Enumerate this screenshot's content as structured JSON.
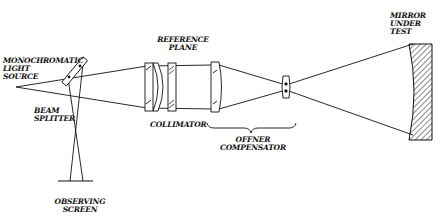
{
  "diagram": {
    "type": "optical interferometer setup (Fizeau with Offner null compensator)",
    "colors": {
      "line": "#111111",
      "background": "#ffffff"
    },
    "labels": {
      "light_source": "MONOCHROMATIC\nLIGHT\nSOURCE",
      "beam_splitter": "BEAM\nSPLITTER",
      "collimator": "COLLIMATOR",
      "reference_plane": "REFERENCE\nPLANE",
      "offner_compensator": "OFFNER\nCOMPENSATOR",
      "mirror_under_test": "MIRROR\nUNDER\nTEST",
      "observing_screen": "OBSERVING\nSCREEN"
    },
    "components": [
      {
        "id": "light-source",
        "label": "MONOCHROMATIC LIGHT SOURCE"
      },
      {
        "id": "beam-splitter",
        "label": "BEAM SPLITTER"
      },
      {
        "id": "collimator",
        "label": "COLLIMATOR"
      },
      {
        "id": "reference-plane",
        "label": "REFERENCE PLANE"
      },
      {
        "id": "offner-compensator",
        "label": "OFFNER COMPENSATOR"
      },
      {
        "id": "mirror-under-test",
        "label": "MIRROR UNDER TEST"
      },
      {
        "id": "observing-screen",
        "label": "OBSERVING SCREEN"
      }
    ]
  }
}
